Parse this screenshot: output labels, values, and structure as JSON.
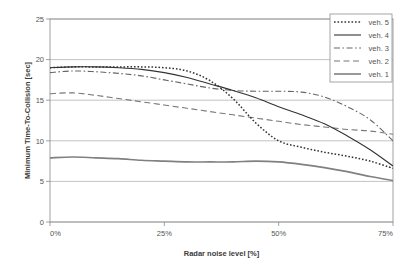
{
  "chart_data": {
    "type": "line",
    "title": "",
    "xlabel": "Radar noise level [%]",
    "ylabel": "Minimum Time-To-Collision [sec]",
    "xlim": [
      0,
      75
    ],
    "ylim": [
      0,
      25
    ],
    "grid": true,
    "legend_position": "top-right",
    "x_tick_labels": [
      "0%",
      "25%",
      "50%",
      "75%"
    ],
    "x_tick_values": [
      0,
      25,
      50,
      75
    ],
    "y_tick_labels": [
      "0",
      "5",
      "10",
      "15",
      "20",
      "25"
    ],
    "y_tick_values": [
      0,
      5,
      10,
      15,
      20,
      25
    ],
    "x": [
      0,
      5,
      10,
      15,
      20,
      25,
      30,
      35,
      40,
      45,
      50,
      55,
      60,
      65,
      70,
      75
    ],
    "series": [
      {
        "name": "veh. 5",
        "style": "dotted",
        "color": "#333333",
        "values": [
          19.0,
          19.1,
          19.1,
          19.1,
          19.1,
          19.0,
          18.6,
          17.4,
          15.2,
          12.2,
          10.0,
          9.2,
          8.6,
          8.1,
          7.5,
          6.6
        ]
      },
      {
        "name": "veh. 4",
        "style": "solid",
        "color": "#333333",
        "values": [
          19.0,
          19.1,
          19.1,
          19.0,
          18.8,
          18.4,
          17.8,
          17.0,
          16.2,
          15.3,
          14.2,
          13.2,
          12.1,
          10.6,
          8.9,
          6.9
        ]
      },
      {
        "name": "veh. 3",
        "style": "dashdot",
        "color": "#666666",
        "values": [
          18.4,
          18.6,
          18.5,
          18.3,
          18.0,
          17.5,
          17.0,
          16.5,
          16.2,
          16.1,
          16.1,
          16.0,
          15.4,
          14.2,
          12.6,
          10.0
        ]
      },
      {
        "name": "veh. 2",
        "style": "dashed",
        "color": "#777777",
        "values": [
          15.8,
          15.9,
          15.6,
          15.2,
          14.8,
          14.4,
          14.0,
          13.6,
          13.2,
          12.8,
          12.4,
          12.0,
          11.7,
          11.4,
          11.2,
          10.8
        ]
      },
      {
        "name": "veh. 1",
        "style": "solid-thick",
        "color": "#808080",
        "values": [
          7.9,
          8.0,
          7.9,
          7.8,
          7.6,
          7.5,
          7.4,
          7.4,
          7.4,
          7.5,
          7.4,
          7.1,
          6.7,
          6.2,
          5.6,
          5.1
        ]
      }
    ]
  },
  "legend": {
    "items": [
      {
        "label": "veh. 5"
      },
      {
        "label": "veh. 4"
      },
      {
        "label": "veh. 3"
      },
      {
        "label": "veh. 2"
      },
      {
        "label": "veh. 1"
      }
    ]
  }
}
